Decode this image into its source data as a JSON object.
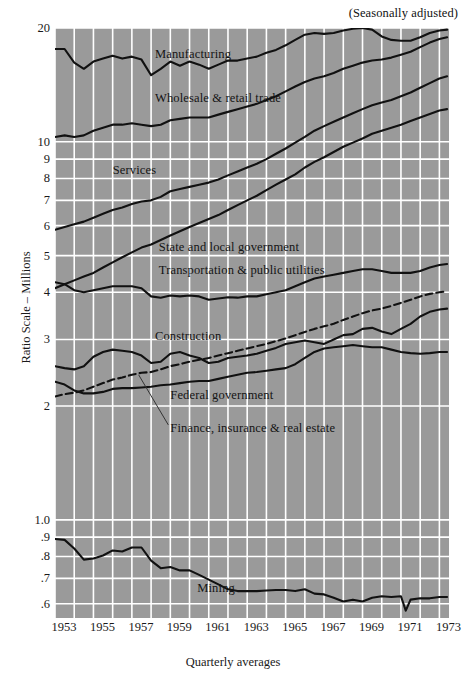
{
  "header": {
    "note": "(Seasonally adjusted)"
  },
  "chart_data": {
    "type": "line",
    "title": "",
    "subtitle": "(Seasonally adjusted)",
    "xlabel": "Quarterly averages",
    "ylabel": "Ratio Scale – Millions",
    "scale": "log",
    "grid": true,
    "legend_position": "inline-annotations",
    "plot_bgcolor": "#9a9a9a",
    "gridcolor": "#ffffff",
    "linecolor": "#111111",
    "xlim": [
      1953,
      1973.5
    ],
    "ylim": [
      0.55,
      20
    ],
    "x_ticks": [
      "1953",
      "1955",
      "1957",
      "1959",
      "1961",
      "1963",
      "1965",
      "1967",
      "1969",
      "1971",
      "1973"
    ],
    "x_tick_values": [
      1953,
      1955,
      1957,
      1959,
      1961,
      1963,
      1965,
      1967,
      1969,
      1971,
      1973
    ],
    "x_minor_step": 1,
    "y_ticks": [
      "20",
      "10",
      "9",
      "8",
      "7",
      "6",
      "5",
      "4",
      "3",
      "2",
      "1.0",
      ".9",
      ".8",
      ".7",
      ".6"
    ],
    "y_tick_values": [
      20,
      10,
      9,
      8,
      7,
      6,
      5,
      4,
      3,
      2,
      1.0,
      0.9,
      0.8,
      0.7,
      0.6
    ],
    "annotations": [
      {
        "text": "Manufacturing",
        "x": 1958.2,
        "y": 17.0
      },
      {
        "text": "Wholesale & retail trade",
        "x": 1958.2,
        "y": 13.0
      },
      {
        "text": "Services",
        "x": 1956.0,
        "y": 8.35
      },
      {
        "text": "State and local government",
        "x": 1958.4,
        "y": 5.25
      },
      {
        "text": "Transportation & public utilities",
        "x": 1958.4,
        "y": 4.55
      },
      {
        "text": "Construction",
        "x": 1958.2,
        "y": 3.05
      },
      {
        "text": "Federal government",
        "x": 1959.0,
        "y": 2.12
      },
      {
        "text": "Finance, insurance & real estate",
        "x": 1959.0,
        "y": 1.74,
        "leader": true
      },
      {
        "text": "Mining",
        "x": 1960.4,
        "y": 0.655
      }
    ],
    "series": [
      {
        "name": "Manufacturing",
        "style": "solid",
        "x": [
          1953.0,
          1953.5,
          1954.0,
          1954.5,
          1955.0,
          1955.5,
          1956.0,
          1956.5,
          1957.0,
          1957.5,
          1958.0,
          1958.5,
          1959.0,
          1959.5,
          1960.0,
          1960.5,
          1961.0,
          1961.5,
          1962.0,
          1962.5,
          1963.0,
          1963.5,
          1964.0,
          1964.5,
          1965.0,
          1965.5,
          1966.0,
          1966.5,
          1967.0,
          1967.5,
          1968.0,
          1968.5,
          1969.0,
          1969.5,
          1970.0,
          1970.5,
          1971.0,
          1971.5,
          1972.0,
          1972.5,
          1973.0,
          1973.4
        ],
        "y": [
          17.6,
          17.6,
          16.2,
          15.6,
          16.3,
          16.6,
          16.9,
          16.6,
          16.8,
          16.5,
          15.0,
          15.6,
          16.3,
          15.9,
          16.3,
          16.0,
          15.6,
          16.0,
          16.4,
          16.4,
          16.6,
          16.8,
          17.2,
          17.5,
          18.0,
          18.6,
          19.2,
          19.4,
          19.3,
          19.4,
          19.7,
          19.9,
          20.0,
          19.8,
          19.0,
          18.6,
          18.5,
          18.5,
          18.9,
          19.4,
          19.7,
          19.8
        ]
      },
      {
        "name": "Wholesale & retail trade",
        "style": "solid",
        "x": [
          1953.0,
          1953.5,
          1954.0,
          1954.5,
          1955.0,
          1955.5,
          1956.0,
          1956.5,
          1957.0,
          1957.5,
          1958.0,
          1958.5,
          1959.0,
          1959.5,
          1960.0,
          1960.5,
          1961.0,
          1961.5,
          1962.0,
          1962.5,
          1963.0,
          1963.5,
          1964.0,
          1964.5,
          1965.0,
          1965.5,
          1966.0,
          1966.5,
          1967.0,
          1967.5,
          1968.0,
          1968.5,
          1969.0,
          1969.5,
          1970.0,
          1970.5,
          1971.0,
          1971.5,
          1972.0,
          1972.5,
          1973.0,
          1973.4
        ],
        "y": [
          10.3,
          10.4,
          10.3,
          10.4,
          10.7,
          10.9,
          11.1,
          11.1,
          11.2,
          11.1,
          11.0,
          11.1,
          11.4,
          11.5,
          11.6,
          11.6,
          11.6,
          11.8,
          12.0,
          12.2,
          12.4,
          12.6,
          12.9,
          13.2,
          13.6,
          14.0,
          14.4,
          14.7,
          14.9,
          15.2,
          15.6,
          15.9,
          16.2,
          16.4,
          16.5,
          16.7,
          17.0,
          17.3,
          17.8,
          18.3,
          18.7,
          18.9
        ]
      },
      {
        "name": "Services",
        "style": "solid",
        "x": [
          1953.0,
          1953.5,
          1954.0,
          1954.5,
          1955.0,
          1955.5,
          1956.0,
          1956.5,
          1957.0,
          1957.5,
          1958.0,
          1958.5,
          1959.0,
          1959.5,
          1960.0,
          1960.5,
          1961.0,
          1961.5,
          1962.0,
          1962.5,
          1963.0,
          1963.5,
          1964.0,
          1964.5,
          1965.0,
          1965.5,
          1966.0,
          1966.5,
          1967.0,
          1967.5,
          1968.0,
          1968.5,
          1969.0,
          1969.5,
          1970.0,
          1970.5,
          1971.0,
          1971.5,
          1972.0,
          1972.5,
          1973.0,
          1973.4
        ],
        "y": [
          5.85,
          5.95,
          6.05,
          6.15,
          6.3,
          6.45,
          6.6,
          6.7,
          6.85,
          6.95,
          7.0,
          7.15,
          7.4,
          7.5,
          7.6,
          7.7,
          7.8,
          7.95,
          8.15,
          8.35,
          8.55,
          8.75,
          9.0,
          9.3,
          9.6,
          9.95,
          10.3,
          10.7,
          11.0,
          11.3,
          11.6,
          11.9,
          12.2,
          12.5,
          12.7,
          12.9,
          13.2,
          13.5,
          13.9,
          14.3,
          14.7,
          14.9
        ]
      },
      {
        "name": "State and local government",
        "style": "solid",
        "x": [
          1953.0,
          1953.5,
          1954.0,
          1954.5,
          1955.0,
          1955.5,
          1956.0,
          1956.5,
          1957.0,
          1957.5,
          1958.0,
          1958.5,
          1959.0,
          1959.5,
          1960.0,
          1960.5,
          1961.0,
          1961.5,
          1962.0,
          1962.5,
          1963.0,
          1963.5,
          1964.0,
          1964.5,
          1965.0,
          1965.5,
          1966.0,
          1966.5,
          1967.0,
          1967.5,
          1968.0,
          1968.5,
          1969.0,
          1969.5,
          1970.0,
          1970.5,
          1971.0,
          1971.5,
          1972.0,
          1972.5,
          1973.0,
          1973.4
        ],
        "y": [
          4.1,
          4.2,
          4.3,
          4.4,
          4.5,
          4.65,
          4.8,
          4.95,
          5.1,
          5.25,
          5.35,
          5.5,
          5.65,
          5.8,
          5.95,
          6.1,
          6.25,
          6.4,
          6.6,
          6.8,
          7.0,
          7.2,
          7.45,
          7.7,
          7.95,
          8.2,
          8.55,
          8.85,
          9.1,
          9.4,
          9.7,
          9.95,
          10.2,
          10.5,
          10.7,
          10.9,
          11.1,
          11.35,
          11.6,
          11.85,
          12.1,
          12.2
        ]
      },
      {
        "name": "Transportation & public utilities",
        "style": "solid",
        "x": [
          1953.0,
          1953.5,
          1954.0,
          1954.5,
          1955.0,
          1955.5,
          1956.0,
          1956.5,
          1957.0,
          1957.5,
          1958.0,
          1958.5,
          1959.0,
          1959.5,
          1960.0,
          1960.5,
          1961.0,
          1961.5,
          1962.0,
          1962.5,
          1963.0,
          1963.5,
          1964.0,
          1964.5,
          1965.0,
          1965.5,
          1966.0,
          1966.5,
          1967.0,
          1967.5,
          1968.0,
          1968.5,
          1969.0,
          1969.5,
          1970.0,
          1970.5,
          1971.0,
          1971.5,
          1972.0,
          1972.5,
          1973.0,
          1973.4
        ],
        "y": [
          4.25,
          4.2,
          4.05,
          4.0,
          4.05,
          4.1,
          4.15,
          4.15,
          4.15,
          4.1,
          3.9,
          3.87,
          3.92,
          3.9,
          3.92,
          3.9,
          3.82,
          3.85,
          3.88,
          3.87,
          3.9,
          3.9,
          3.95,
          4.0,
          4.05,
          4.15,
          4.25,
          4.35,
          4.4,
          4.45,
          4.5,
          4.55,
          4.6,
          4.6,
          4.55,
          4.5,
          4.5,
          4.5,
          4.55,
          4.65,
          4.72,
          4.75
        ]
      },
      {
        "name": "Construction",
        "style": "solid",
        "x": [
          1953.0,
          1953.5,
          1954.0,
          1954.5,
          1955.0,
          1955.5,
          1956.0,
          1956.5,
          1957.0,
          1957.5,
          1958.0,
          1958.5,
          1959.0,
          1959.5,
          1960.0,
          1960.5,
          1961.0,
          1961.5,
          1962.0,
          1962.5,
          1963.0,
          1963.5,
          1964.0,
          1964.5,
          1965.0,
          1965.5,
          1966.0,
          1966.5,
          1967.0,
          1967.5,
          1968.0,
          1968.5,
          1969.0,
          1969.5,
          1970.0,
          1970.5,
          1971.0,
          1971.5,
          1972.0,
          1972.5,
          1973.0,
          1973.4
        ],
        "y": [
          2.55,
          2.52,
          2.5,
          2.55,
          2.7,
          2.78,
          2.82,
          2.8,
          2.78,
          2.72,
          2.6,
          2.62,
          2.75,
          2.78,
          2.72,
          2.68,
          2.6,
          2.62,
          2.68,
          2.7,
          2.72,
          2.75,
          2.8,
          2.85,
          2.92,
          2.95,
          2.98,
          2.95,
          2.92,
          3.0,
          3.08,
          3.1,
          3.2,
          3.22,
          3.15,
          3.1,
          3.2,
          3.3,
          3.45,
          3.55,
          3.6,
          3.62
        ]
      },
      {
        "name": "Federal government",
        "style": "solid",
        "x": [
          1953.0,
          1953.5,
          1954.0,
          1954.5,
          1955.0,
          1955.5,
          1956.0,
          1956.5,
          1957.0,
          1957.5,
          1958.0,
          1958.5,
          1959.0,
          1959.5,
          1960.0,
          1960.5,
          1961.0,
          1961.5,
          1962.0,
          1962.5,
          1963.0,
          1963.5,
          1964.0,
          1964.5,
          1965.0,
          1965.5,
          1966.0,
          1966.5,
          1967.0,
          1967.5,
          1968.0,
          1968.5,
          1969.0,
          1969.5,
          1970.0,
          1970.5,
          1971.0,
          1971.5,
          1972.0,
          1972.5,
          1973.0,
          1973.4
        ],
        "y": [
          2.32,
          2.28,
          2.2,
          2.16,
          2.16,
          2.18,
          2.22,
          2.23,
          2.23,
          2.24,
          2.25,
          2.27,
          2.28,
          2.3,
          2.32,
          2.33,
          2.33,
          2.36,
          2.39,
          2.42,
          2.45,
          2.46,
          2.48,
          2.5,
          2.52,
          2.58,
          2.68,
          2.78,
          2.84,
          2.86,
          2.88,
          2.9,
          2.88,
          2.86,
          2.86,
          2.82,
          2.78,
          2.76,
          2.75,
          2.76,
          2.78,
          2.78
        ]
      },
      {
        "name": "Finance, insurance & real estate",
        "style": "dashed",
        "x": [
          1953.0,
          1953.5,
          1954.0,
          1954.5,
          1955.0,
          1955.5,
          1956.0,
          1956.5,
          1957.0,
          1957.5,
          1958.0,
          1958.5,
          1959.0,
          1959.5,
          1960.0,
          1960.5,
          1961.0,
          1961.5,
          1962.0,
          1962.5,
          1963.0,
          1963.5,
          1964.0,
          1964.5,
          1965.0,
          1965.5,
          1966.0,
          1966.5,
          1967.0,
          1967.5,
          1968.0,
          1968.5,
          1969.0,
          1969.5,
          1970.0,
          1970.5,
          1971.0,
          1971.5,
          1972.0,
          1972.5,
          1973.0,
          1973.4
        ],
        "y": [
          2.12,
          2.15,
          2.17,
          2.2,
          2.25,
          2.3,
          2.35,
          2.38,
          2.42,
          2.45,
          2.46,
          2.5,
          2.55,
          2.58,
          2.62,
          2.65,
          2.68,
          2.72,
          2.76,
          2.8,
          2.84,
          2.88,
          2.92,
          2.97,
          3.02,
          3.08,
          3.14,
          3.2,
          3.25,
          3.3,
          3.38,
          3.45,
          3.52,
          3.58,
          3.62,
          3.68,
          3.75,
          3.82,
          3.9,
          3.96,
          4.0,
          4.02
        ]
      },
      {
        "name": "Mining",
        "style": "solid",
        "x": [
          1953.0,
          1953.5,
          1954.0,
          1954.5,
          1955.0,
          1955.5,
          1956.0,
          1956.5,
          1957.0,
          1957.5,
          1958.0,
          1958.5,
          1959.0,
          1959.5,
          1960.0,
          1960.5,
          1961.0,
          1961.5,
          1962.0,
          1962.5,
          1963.0,
          1963.5,
          1964.0,
          1964.5,
          1965.0,
          1965.5,
          1966.0,
          1966.5,
          1967.0,
          1967.5,
          1968.0,
          1968.5,
          1969.0,
          1969.5,
          1970.0,
          1970.5,
          1971.0,
          1971.25,
          1971.5,
          1972.0,
          1972.5,
          1973.0,
          1973.4
        ],
        "y": [
          0.89,
          0.885,
          0.84,
          0.785,
          0.79,
          0.805,
          0.83,
          0.825,
          0.845,
          0.845,
          0.78,
          0.745,
          0.75,
          0.735,
          0.735,
          0.715,
          0.695,
          0.675,
          0.655,
          0.648,
          0.648,
          0.648,
          0.65,
          0.652,
          0.652,
          0.648,
          0.655,
          0.638,
          0.635,
          0.622,
          0.608,
          0.615,
          0.608,
          0.622,
          0.628,
          0.625,
          0.628,
          0.575,
          0.615,
          0.62,
          0.62,
          0.625,
          0.625
        ]
      }
    ]
  },
  "xaxis": {
    "title": "Quarterly averages"
  }
}
